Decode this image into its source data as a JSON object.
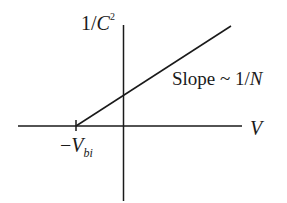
{
  "diagram": {
    "y_axis_label": {
      "prefix": "1/",
      "var": "C",
      "exp": "2"
    },
    "x_axis_label": "V",
    "slope_label": {
      "text": "Slope ~ 1/",
      "var": "N"
    },
    "intercept_label": {
      "sign": "−",
      "var": "V",
      "sub": "bi"
    },
    "colors": {
      "ink": "#1a1a1a",
      "background": "#ffffff"
    }
  }
}
